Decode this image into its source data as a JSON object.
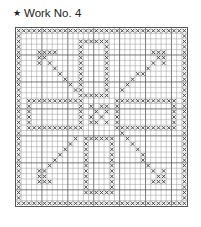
{
  "title": {
    "bullet": "★",
    "text": "Work No. 4"
  },
  "chart": {
    "type": "filet crochet / cross-stitch chart",
    "cols": 33,
    "rows": 33,
    "grid_color": "#888888",
    "thick_line_every": 5,
    "thick_grid_color": "#555555",
    "stitch_color": "#444444",
    "background": "#ffffff",
    "motif_description": "square border, four rectangular frames around a central checker block, diagonal arrows pointing to the top-left, top-right, bottom-left and bottom-right corners"
  },
  "pattern": {
    "border": true,
    "rect_frames": [
      {
        "name": "top-frame",
        "r0": 2,
        "r1": 12,
        "c0": 12,
        "c1": 17
      },
      {
        "name": "bottom-frame",
        "r0": 20,
        "r1": 30,
        "c0": 13,
        "c1": 18
      },
      {
        "name": "left-frame",
        "r0": 13,
        "r1": 18,
        "c0": 2,
        "c1": 12
      },
      {
        "name": "right-frame",
        "r0": 13,
        "r1": 18,
        "c0": 19,
        "c1": 30
      }
    ],
    "center_cells": [
      [
        14,
        14
      ],
      [
        14,
        16
      ],
      [
        15,
        15
      ],
      [
        15,
        17
      ],
      [
        16,
        14
      ],
      [
        16,
        16
      ],
      [
        17,
        15
      ],
      [
        17,
        17
      ],
      [
        14,
        17
      ],
      [
        17,
        14
      ]
    ],
    "diagonals": [
      {
        "name": "arrow-top-left",
        "from": [
          4,
          4
        ],
        "to": [
          12,
          12
        ]
      },
      {
        "name": "arrow-top-right",
        "from": [
          4,
          28
        ],
        "to": [
          11,
          20
        ]
      },
      {
        "name": "arrow-bottom-left",
        "from": [
          27,
          4
        ],
        "to": [
          20,
          11
        ]
      },
      {
        "name": "arrow-bottom-right",
        "from": [
          28,
          28
        ],
        "to": [
          19,
          20
        ]
      }
    ],
    "arrowheads": [
      {
        "cells": [
          [
            4,
            4
          ],
          [
            4,
            5
          ],
          [
            4,
            6
          ],
          [
            4,
            7
          ],
          [
            5,
            4
          ],
          [
            6,
            4
          ]
        ]
      },
      {
        "cells": [
          [
            4,
            26
          ],
          [
            4,
            27
          ],
          [
            4,
            28
          ],
          [
            5,
            28
          ],
          [
            6,
            28
          ],
          [
            5,
            27
          ]
        ]
      },
      {
        "cells": [
          [
            26,
            4
          ],
          [
            27,
            4
          ],
          [
            28,
            4
          ],
          [
            28,
            5
          ],
          [
            28,
            6
          ],
          [
            27,
            5
          ]
        ]
      },
      {
        "cells": [
          [
            28,
            26
          ],
          [
            28,
            27
          ],
          [
            28,
            28
          ],
          [
            27,
            28
          ],
          [
            26,
            28
          ],
          [
            27,
            27
          ]
        ]
      }
    ]
  }
}
